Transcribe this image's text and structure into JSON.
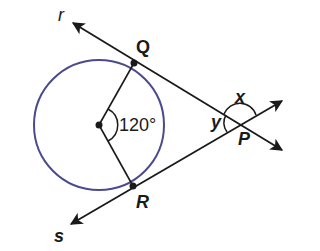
{
  "diagram": {
    "type": "circle-tangent-geometry",
    "colors": {
      "circle": "#4a4a8c",
      "lines": "#1a1a1a",
      "background": "#ffffff"
    },
    "circle": {
      "center": [
        99,
        125
      ],
      "radius": 65
    },
    "points": {
      "Q": {
        "label": "Q",
        "xy": [
          134,
          63
        ]
      },
      "R": {
        "label": "R",
        "xy": [
          133,
          186
        ]
      },
      "P": {
        "label": "P",
        "xy": [
          240,
          124
        ]
      },
      "center": {
        "xy": [
          99,
          125
        ]
      }
    },
    "rays": {
      "r": {
        "label": "r"
      },
      "s": {
        "label": "s"
      }
    },
    "angles": {
      "central": {
        "label": "120°"
      },
      "x": {
        "label": "x"
      },
      "y": {
        "label": "y"
      }
    }
  }
}
